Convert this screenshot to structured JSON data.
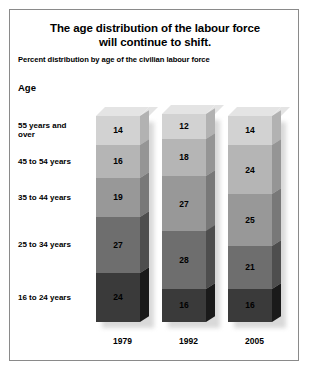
{
  "figure": {
    "title_line1": "The age distribution of the labour force",
    "title_line2": "will continue to shift.",
    "subtitle": "Percent distribution by age of the civilian labour force",
    "age_heading": "Age"
  },
  "chart_data": {
    "type": "bar",
    "subtype": "stacked-column-3d",
    "title": "The age distribution of the labour force will continue to shift.",
    "subtitle": "Percent distribution by age of the civilian labour force",
    "xlabel": "",
    "ylabel": "Age",
    "categories": [
      "1979",
      "1992",
      "2005"
    ],
    "stack_order": "bottom-to-top",
    "series": [
      {
        "name": "16 to 24 years",
        "values": [
          24,
          16,
          16
        ],
        "color": "#3a3a3a"
      },
      {
        "name": "25 to 34 years",
        "values": [
          27,
          28,
          21
        ],
        "color": "#6e6e6e"
      },
      {
        "name": "35 to 44 years",
        "values": [
          19,
          27,
          25
        ],
        "color": "#989898"
      },
      {
        "name": "45 to 54 years",
        "values": [
          16,
          18,
          24
        ],
        "color": "#b5b5b5"
      },
      {
        "name": "55 years and over",
        "values": [
          14,
          12,
          14
        ],
        "color": "#d2d2d2"
      }
    ],
    "ylim": [
      0,
      100
    ],
    "grid": false,
    "legend": "row-labels-left",
    "units": "percent"
  },
  "row_labels": [
    {
      "id": "age-55-plus",
      "text": "55 years and\nover"
    },
    {
      "id": "age-45-54",
      "text": "45 to 54 years"
    },
    {
      "id": "age-35-44",
      "text": "35 to 44 years"
    },
    {
      "id": "age-25-34",
      "text": "25 to 34 years"
    },
    {
      "id": "age-16-24",
      "text": "16 to 24 years"
    }
  ],
  "colors": {
    "band_55_plus": "#d2d2d2",
    "band_45_54": "#b5b5b5",
    "band_35_44": "#989898",
    "band_25_34": "#6e6e6e",
    "band_16_24": "#3a3a3a",
    "frame_border": "#8a8a8a",
    "background": "#ffffff",
    "text": "#000000"
  }
}
